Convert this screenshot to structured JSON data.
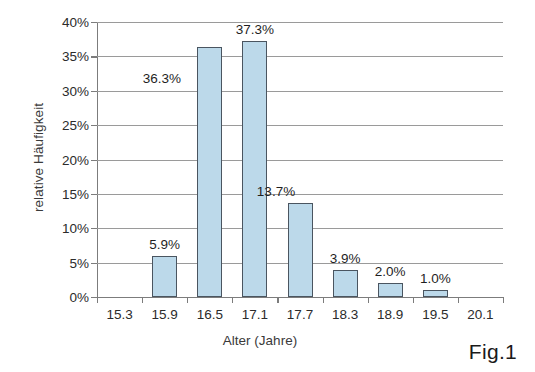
{
  "chart_data": {
    "type": "bar",
    "title": "",
    "xlabel": "Alter (Jahre)",
    "ylabel": "relative Häufigkeit",
    "categories": [
      "15.3",
      "15.9",
      "16.5",
      "17.1",
      "17.7",
      "18.3",
      "18.9",
      "19.5",
      "20.1"
    ],
    "values": [
      null,
      5.9,
      36.3,
      37.3,
      13.7,
      3.9,
      2.0,
      1.0,
      null
    ],
    "data_labels": [
      "",
      "5.9%",
      "36.3%",
      "37.3%",
      "13.7%",
      "3.9%",
      "2.0%",
      "1.0%",
      ""
    ],
    "ylim": [
      0,
      40
    ],
    "ytick_values": [
      0,
      5,
      10,
      15,
      20,
      25,
      30,
      35,
      40
    ],
    "ytick_labels": [
      "0%",
      "5%",
      "10%",
      "15%",
      "20%",
      "25%",
      "30%",
      "35%",
      "40%"
    ],
    "xtick_labels": [
      "15.3",
      "15.9",
      "16.5",
      "17.1",
      "17.7",
      "18.3",
      "18.9",
      "19.5",
      "20.1"
    ],
    "grid": true,
    "grid_axis": "y",
    "legend": false,
    "bar_fill_color": "#bcd9ea",
    "bar_border_color": "#4a5560",
    "background_color": "#ffffff",
    "axis_color": "#7c7c7c"
  },
  "caption": {
    "figure_label": "Fig.1"
  }
}
